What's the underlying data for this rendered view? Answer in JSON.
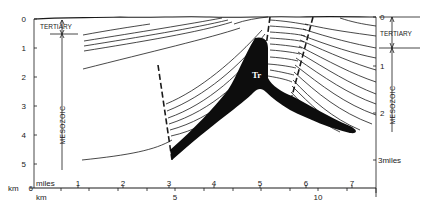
{
  "diagram": {
    "type": "geological-cross-section",
    "colors": {
      "ink": "#1a1a1a",
      "fill": "#0d0d0d",
      "background": "#ffffff"
    },
    "left_axis": {
      "unit_label": "km",
      "ticks": [
        "0",
        "1",
        "2",
        "3",
        "4",
        "5",
        "6"
      ]
    },
    "right_axis": {
      "unit_label": "miles",
      "ticks": [
        "0",
        "1",
        "2",
        "3miles"
      ]
    },
    "units": {
      "left": {
        "tertiary": "TERTIARY",
        "mesozoic": "MESOZOIC"
      },
      "right": {
        "tertiary": "TERTIARY",
        "mesozoic": "MESOZOIC"
      }
    },
    "salt_label": "Tr",
    "bottom_axis": {
      "miles_label": "miles",
      "miles_ticks": [
        "1",
        "2",
        "3",
        "4",
        "5",
        "6",
        "7"
      ],
      "km_label": "km",
      "km_ticks": [
        "5",
        "10"
      ]
    }
  }
}
